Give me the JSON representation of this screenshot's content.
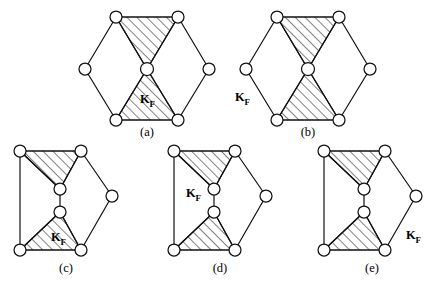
{
  "figure": {
    "type": "diagram",
    "background_color": "#ffffff",
    "line_color": "#111111",
    "node_fill": "#ffffff",
    "hatch_angle_deg": 45,
    "panels": [
      {
        "id": "a",
        "label": "(a)",
        "shape": "regular-hexagon-with-center-node",
        "kf_label": "K",
        "kf_subscript": "F",
        "kf_position": "inside-lower-triangle",
        "node_count": 7,
        "hatched_region_count": 2,
        "hatched_regions": [
          "upper-triangle",
          "lower-triangle"
        ]
      },
      {
        "id": "b",
        "label": "(b)",
        "shape": "regular-hexagon-with-center-node",
        "kf_label": "K",
        "kf_subscript": "F",
        "kf_position": "outside-left",
        "node_count": 7,
        "hatched_region_count": 2,
        "hatched_regions": [
          "upper-triangle",
          "lower-triangle"
        ]
      },
      {
        "id": "c",
        "label": "(c)",
        "shape": "elongated-hexagon-with-two-inner-nodes",
        "kf_label": "K",
        "kf_subscript": "F",
        "kf_position": "inside-lower-triangle",
        "node_count": 8,
        "hatched_region_count": 2,
        "hatched_regions": [
          "upper-left-triangle",
          "lower-left-triangle"
        ]
      },
      {
        "id": "d",
        "label": "(d)",
        "shape": "elongated-hexagon-with-two-inner-nodes",
        "kf_label": "K",
        "kf_subscript": "F",
        "kf_position": "inside-middle-left",
        "node_count": 8,
        "hatched_region_count": 2,
        "hatched_regions": [
          "upper-left-triangle",
          "lower-left-triangle"
        ]
      },
      {
        "id": "e",
        "label": "(e)",
        "shape": "elongated-hexagon-with-two-inner-nodes",
        "kf_label": "K",
        "kf_subscript": "F",
        "kf_position": "outside-lower-right",
        "node_count": 8,
        "hatched_region_count": 2,
        "hatched_regions": [
          "upper-left-triangle",
          "lower-left-triangle"
        ]
      }
    ]
  }
}
